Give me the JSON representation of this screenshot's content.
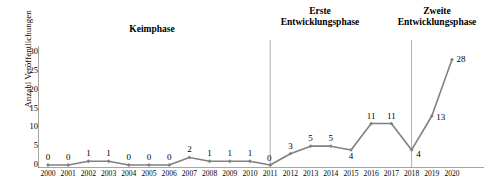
{
  "chart_data": {
    "type": "line",
    "title": "",
    "xlabel": "",
    "ylabel": "Anzahl Veröffentlichungen",
    "ylim": [
      0,
      30
    ],
    "yticks": [
      0,
      5,
      10,
      15,
      20,
      25,
      30
    ],
    "grid": false,
    "legend": "none",
    "marker": "diamond",
    "line_color": "#808080",
    "categories": [
      "2000",
      "2001",
      "2002",
      "2003",
      "2004",
      "2005",
      "2006",
      "2007",
      "2008",
      "2009",
      "2010",
      "2011",
      "2012",
      "2013",
      "2014",
      "2015",
      "2016",
      "2017",
      "2018",
      "2019",
      "2020"
    ],
    "values": [
      0,
      0,
      1,
      1,
      0,
      0,
      0,
      2,
      1,
      1,
      1,
      0,
      3,
      5,
      5,
      4,
      11,
      11,
      4,
      13,
      28
    ],
    "data_labels": [
      "0",
      "0",
      "1",
      "1",
      "0",
      "0",
      "0",
      "2",
      "1",
      "1",
      "1",
      "0",
      "3",
      "5",
      "5",
      "4",
      "11",
      "11",
      "4",
      "13",
      "28"
    ],
    "annotations": [
      {
        "name": "keimphase",
        "text": "Keimphase",
        "span": [
          "2000",
          "2010"
        ]
      },
      {
        "name": "erste-entwicklungsphase",
        "text": "Erste\nEntwicklungsphase",
        "span": [
          "2011",
          "2017"
        ]
      },
      {
        "name": "zweite-entwicklungsphase",
        "text": "Zweite\nEntwicklungsphase",
        "span": [
          "2018",
          "2020"
        ]
      }
    ],
    "dividers": [
      "2011",
      "2018"
    ],
    "divider_color": "#9a9a9a"
  }
}
